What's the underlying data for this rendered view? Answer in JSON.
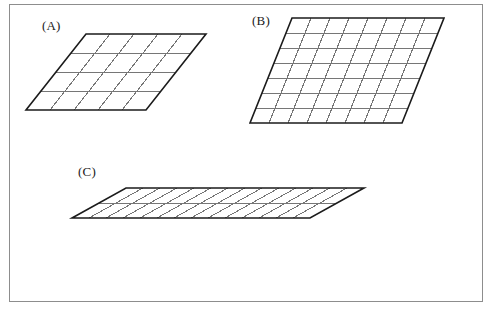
{
  "page": {
    "background_color": "#ffffff",
    "border_color": "#8d8d8d",
    "outline_color": "#1b1b1b",
    "grid_color": "#767676"
  },
  "figures": [
    {
      "label": "(A)",
      "name": "parallelogram-a",
      "cols": 5,
      "rows": 4,
      "cell_width": 24,
      "cell_height": 19,
      "skew_x": 60,
      "outline_color": "#1b1b1b",
      "grid_color": "#767676",
      "fill": "#ffffff",
      "unit_squares": 20
    },
    {
      "label": "(B)",
      "name": "parallelogram-b",
      "cols": 8,
      "rows": 7,
      "cell_width": 19,
      "cell_height": 15,
      "skew_x": 42,
      "outline_color": "#1b1b1b",
      "grid_color": "#767676",
      "fill": "#ffffff",
      "unit_squares": 56
    },
    {
      "label": "(C)",
      "name": "parallelogram-c",
      "cols": 14,
      "rows": 2,
      "cell_width": 17,
      "cell_height": 15,
      "skew_x": 54,
      "outline_color": "#1b1b1b",
      "grid_color": "#767676",
      "fill": "#ffffff",
      "unit_squares": 28
    }
  ]
}
